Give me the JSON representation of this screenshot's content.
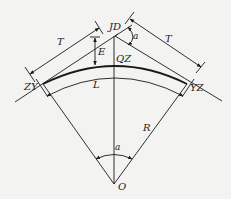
{
  "diagram": {
    "type": "circular-curve-elements",
    "labels": {
      "jd": "JD",
      "qz": "QZ",
      "zy": "ZY",
      "yz": "YZ",
      "o": "O",
      "t_left": "T",
      "t_right": "T",
      "e": "E",
      "l": "L",
      "r": "R",
      "alpha_top": "a",
      "alpha_center": "a"
    },
    "colors": {
      "line": "#1a1a1a",
      "background": "#f3f3f1"
    }
  }
}
